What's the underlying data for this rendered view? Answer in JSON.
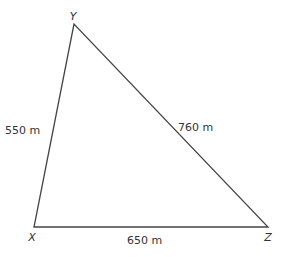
{
  "diagram": {
    "type": "triangle",
    "stroke_color": "#444444",
    "vertices": {
      "Y": {
        "label": "Y",
        "x": 74,
        "y": 24
      },
      "X": {
        "label": "X",
        "x": 34,
        "y": 227
      },
      "Z": {
        "label": "Z",
        "x": 268,
        "y": 227
      }
    },
    "sides": {
      "XY": {
        "label": "550 m",
        "length": 550,
        "unit": "m"
      },
      "YZ": {
        "label": "760 m",
        "length": 760,
        "unit": "m"
      },
      "XZ": {
        "label": "650 m",
        "length": 650,
        "unit": "m"
      }
    }
  }
}
